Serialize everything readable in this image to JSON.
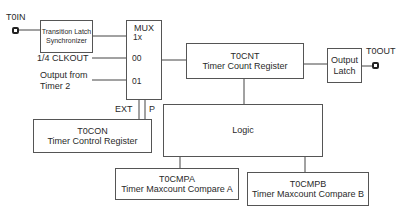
{
  "pins": {
    "input": {
      "label": "T0IN"
    },
    "output": {
      "label": "T0OUT"
    }
  },
  "blocks": {
    "transition_latch": {
      "line1": "Transition Latch",
      "line2": "Synchronizer"
    },
    "mux": {
      "title": "MUX",
      "sel_1x": "1x",
      "sel_00": "00",
      "sel_01": "01"
    },
    "t0cnt": {
      "name": "T0CNT",
      "desc": "Timer Count Register"
    },
    "output_latch": {
      "line1": "Output",
      "line2": "Latch"
    },
    "t0con": {
      "name": "T0CON",
      "desc": "Timer Control Register"
    },
    "logic": {
      "name": "Logic"
    },
    "t0cmpa": {
      "name": "T0CMPA",
      "desc": "Timer Maxcount Compare A"
    },
    "t0cmpb": {
      "name": "T0CMPB",
      "desc": "Timer Maxcount Compare B"
    }
  },
  "signals": {
    "clkout": "1/4 CLKOUT",
    "timer2_line1": "Output from",
    "timer2_line2": "Timer 2",
    "ext": "EXT",
    "p": "P"
  }
}
